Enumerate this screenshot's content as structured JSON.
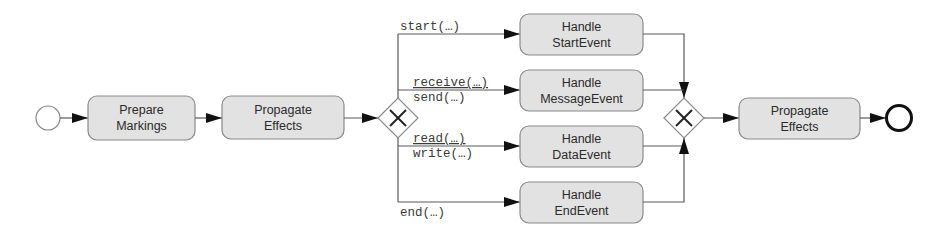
{
  "diagram": {
    "start_event": {
      "type": "start-event"
    },
    "tasks": {
      "prepare": [
        "Prepare",
        "Markings"
      ],
      "propagate1": [
        "Propagate",
        "Effects"
      ],
      "handle_start": [
        "Handle",
        "StartEvent"
      ],
      "handle_message": [
        "Handle",
        "MessageEvent"
      ],
      "handle_data": [
        "Handle",
        "DataEvent"
      ],
      "handle_end": [
        "Handle",
        "EndEvent"
      ],
      "propagate2": [
        "Propagate",
        "Effects"
      ]
    },
    "gateways": {
      "split": {
        "type": "exclusive",
        "icon": "x-icon"
      },
      "join": {
        "type": "exclusive",
        "icon": "x-icon"
      }
    },
    "flow_labels": {
      "start": "start(…)",
      "receive": "receive(…)",
      "send": "send(…)",
      "read": "read(…)",
      "write": "write(…)",
      "end": "end(…)"
    },
    "end_event": {
      "type": "end-event"
    }
  },
  "colors": {
    "task_fill": "#e2e2e2",
    "task_stroke": "#8a8a8a",
    "flow_stroke": "#5a5a5a"
  }
}
